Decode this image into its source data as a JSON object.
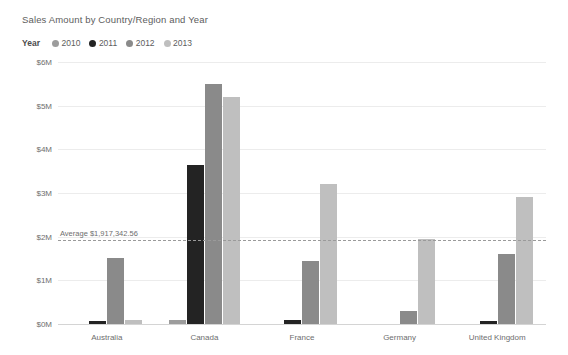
{
  "chart_data": {
    "type": "bar",
    "title": "Sales Amount by Country/Region and Year",
    "xlabel": "",
    "ylabel": "",
    "categories": [
      "Australia",
      "Canada",
      "France",
      "Germany",
      "United Kingdom"
    ],
    "series": [
      {
        "name": "2010",
        "color": "#9c9c9c",
        "values": [
          0,
          100000,
          0,
          0,
          0
        ]
      },
      {
        "name": "2011",
        "color": "#232323",
        "values": [
          60000,
          3650000,
          90000,
          0,
          80000
        ]
      },
      {
        "name": "2012",
        "color": "#8a8a8a",
        "values": [
          1520000,
          5500000,
          1450000,
          300000,
          1600000
        ]
      },
      {
        "name": "2013",
        "color": "#bfbfbf",
        "values": [
          90000,
          5200000,
          3200000,
          1950000,
          2900000
        ]
      }
    ],
    "ylim": [
      0,
      6000000
    ],
    "yticks": [
      {
        "value": 0,
        "label": "$0M"
      },
      {
        "value": 1000000,
        "label": "$1M"
      },
      {
        "value": 2000000,
        "label": "$2M"
      },
      {
        "value": 3000000,
        "label": "$3M"
      },
      {
        "value": 4000000,
        "label": "$4M"
      },
      {
        "value": 5000000,
        "label": "$5M"
      },
      {
        "value": 6000000,
        "label": "$6M"
      }
    ],
    "grid": true,
    "legend_position": "top-left",
    "legend_title": "Year",
    "reference_line": {
      "label": "Average $1,917,342.56",
      "value": 1917342.56
    }
  }
}
